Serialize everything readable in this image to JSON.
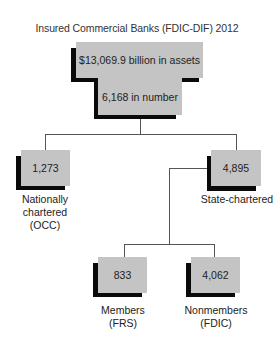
{
  "title": "Insured Commercial Banks (FDIC-DIF) 2012",
  "root": {
    "assets": "$13,069.9 billion in assets",
    "number": "6,168 in number"
  },
  "nodes": {
    "national": {
      "value": "1,273",
      "label": "Nationally\nchartered\n(OCC)"
    },
    "state": {
      "value": "4,895",
      "label": "State-chartered"
    },
    "members": {
      "value": "833",
      "label": "Members\n(FRS)"
    },
    "nonmembers": {
      "value": "4,062",
      "label": "Nonmembers\n(FDIC)"
    }
  },
  "colors": {
    "box_fill": "#c4c4c4",
    "box_shadow": "#0a0a0a",
    "connector": "#555555"
  }
}
